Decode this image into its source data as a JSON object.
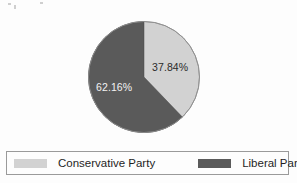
{
  "chart_data": {
    "type": "pie",
    "title": "",
    "categories": [
      "Conservative Party",
      "Liberal Party"
    ],
    "values": [
      37.84,
      62.16
    ],
    "value_labels": [
      "37.84%",
      "62.16%"
    ],
    "colors": [
      "#d2d2d2",
      "#5a5a5a"
    ],
    "start_angle_deg": 0,
    "direction": "clockwise",
    "legend_position": "bottom",
    "grid": false,
    "slices": [
      {
        "name": "Conservative Party",
        "value": 37.84,
        "label": "37.84%",
        "color": "#d2d2d2",
        "label_color": "#2b2b2b"
      },
      {
        "name": "Liberal Party",
        "value": 62.16,
        "label": "62.16%",
        "color": "#5a5a5a",
        "label_color": "#f2f2f2"
      }
    ]
  },
  "legend": {
    "items": [
      {
        "label": "Conservative Party",
        "color": "#d2d2d2"
      },
      {
        "label": "Liberal Party",
        "color": "#5a5a5a"
      }
    ]
  },
  "colors": {
    "conservative": "#d2d2d2",
    "liberal": "#5a5a5a",
    "legend_border": "#9a9a9a",
    "background": "#fdfdfd"
  }
}
